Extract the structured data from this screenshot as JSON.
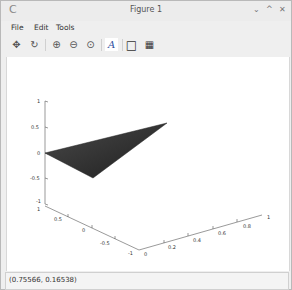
{
  "window": {
    "title": "Figure 1",
    "app_icon": "app-logo-icon",
    "controls": [
      {
        "name": "minimize-icon",
        "glyph": "⌄"
      },
      {
        "name": "maximize-icon",
        "glyph": "^"
      },
      {
        "name": "close-icon",
        "glyph": "✕"
      }
    ]
  },
  "menubar": {
    "items": [
      {
        "label": "File"
      },
      {
        "label": "Edit"
      },
      {
        "label": "Tools"
      }
    ]
  },
  "toolbar": {
    "buttons": [
      {
        "name": "pan-icon",
        "glyph": "✥"
      },
      {
        "name": "rotate-icon",
        "glyph": "↻"
      },
      {
        "name": "zoom-in-icon",
        "glyph": "⊕"
      },
      {
        "name": "zoom-out-icon",
        "glyph": "⊖"
      },
      {
        "name": "zoom-reset-icon",
        "glyph": "⊙"
      },
      {
        "name": "insert-text-icon",
        "glyph": "A"
      },
      {
        "name": "toggle-axes-icon",
        "glyph": "□"
      },
      {
        "name": "toggle-grid-icon",
        "glyph": "▦"
      }
    ]
  },
  "plot": {
    "z_ticks": [
      "1",
      "0.5",
      "0",
      "-0.5",
      "-1"
    ],
    "y_ticks": [
      "1",
      "0.5",
      "0",
      "-0.5",
      "-1"
    ],
    "x_ticks": [
      "0",
      "0.2",
      "0.4",
      "0.6",
      "0.8",
      "1"
    ],
    "patch_color": "#3a3a3a"
  },
  "status": {
    "coordinates": "(0.75566, 0.16538)"
  }
}
